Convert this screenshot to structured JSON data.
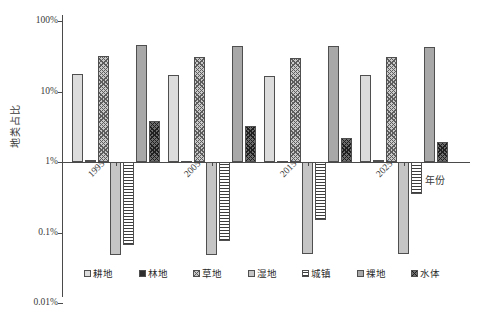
{
  "chart_data": {
    "type": "bar",
    "title": "",
    "xlabel": "年份",
    "ylabel": "地类占比",
    "yscale": "log",
    "ylim": [
      0.01,
      100
    ],
    "ytick_labels": [
      "100%",
      "10%",
      "1%",
      "0.1%",
      "0.01%"
    ],
    "ytick_values": [
      100,
      10,
      1,
      0.1,
      0.01
    ],
    "baseline": 1,
    "grid": false,
    "legend_position": "bottom",
    "categories": [
      "1995",
      "2005",
      "2015",
      "2025"
    ],
    "series": [
      {
        "name": "耕地",
        "pattern": "solid-light-gray",
        "values": [
          17.5,
          17.2,
          16.8,
          17.0
        ]
      },
      {
        "name": "林地",
        "pattern": "solid-black",
        "values": [
          1.06,
          1.05,
          1.04,
          1.07
        ]
      },
      {
        "name": "草地",
        "pattern": "crosshatch-gray",
        "values": [
          32.0,
          31.0,
          30.0,
          31.0
        ]
      },
      {
        "name": "湿地",
        "pattern": "solid-mid-gray",
        "values": [
          0.048,
          0.048,
          0.05,
          0.05
        ]
      },
      {
        "name": "城镇",
        "pattern": "horizontal-stripes",
        "values": [
          0.066,
          0.075,
          0.15,
          0.35
        ]
      },
      {
        "name": "裸地",
        "pattern": "solid-dark-gray",
        "values": [
          45.0,
          44.0,
          44.0,
          43.0
        ]
      },
      {
        "name": "水体",
        "pattern": "crosshatch-dark",
        "values": [
          3.8,
          3.2,
          2.2,
          1.9
        ]
      }
    ]
  },
  "axis": {
    "y_label": "地类占比",
    "x_label": "年份",
    "y_ticks": [
      {
        "label": "100%"
      },
      {
        "label": "10%"
      },
      {
        "label": "1%"
      },
      {
        "label": "0.1%"
      },
      {
        "label": "0.01%"
      }
    ],
    "x_ticks": [
      {
        "label": "1995"
      },
      {
        "label": "2005"
      },
      {
        "label": "2015"
      },
      {
        "label": "2025"
      }
    ]
  },
  "legend": {
    "items": [
      {
        "label": "耕地",
        "pattern": "solid-light-gray"
      },
      {
        "label": "林地",
        "pattern": "solid-black"
      },
      {
        "label": "草地",
        "pattern": "crosshatch-gray"
      },
      {
        "label": "湿地",
        "pattern": "solid-mid-gray"
      },
      {
        "label": "城镇",
        "pattern": "horizontal-stripes"
      },
      {
        "label": "裸地",
        "pattern": "solid-dark-gray"
      },
      {
        "label": "水体",
        "pattern": "crosshatch-dark"
      }
    ]
  },
  "colors": {
    "axis": "#4a4a4a",
    "text": "#2b2b2b",
    "cropland": "#dcdcdc",
    "forest": "#2e2e2e",
    "grassland": "#c9c9c9",
    "wetland": "#c5c5c5",
    "urban": "#f2f2f2",
    "bareland": "#a8a8a8",
    "water": "#6e6e6e"
  }
}
